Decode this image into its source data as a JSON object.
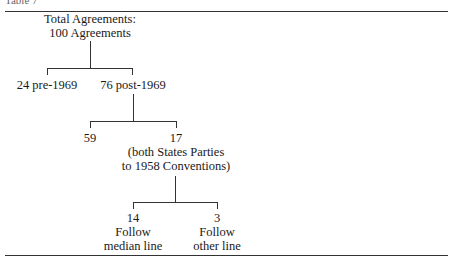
{
  "caption": "Table 7",
  "diagram": {
    "root": {
      "line1": "Total Agreements:",
      "line2": "100 Agreements"
    },
    "level1": {
      "left": "24 pre-1969",
      "right": "76 post-1969"
    },
    "level2": {
      "left": "59",
      "right_count": "17",
      "right_note1": "(both States Parties",
      "right_note2": "to 1958 Conventions)"
    },
    "level3": {
      "left_count": "14",
      "left_line1": "Follow",
      "left_line2": "median line",
      "right_count": "3",
      "right_line1": "Follow",
      "right_line2": "other line"
    }
  }
}
